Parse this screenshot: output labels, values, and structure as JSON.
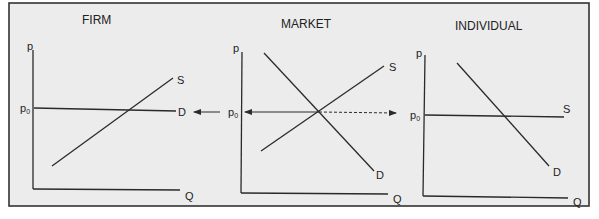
{
  "colors": {
    "background": "#ececec",
    "frame": "#333333",
    "line": "#2a2a2a",
    "page": "#ffffff"
  },
  "panels": [
    {
      "id": "firm",
      "title": "FIRM",
      "y_axis_label": "p",
      "x_axis_label": "Q",
      "price_label": "p",
      "price_subscript": "0",
      "curves": [
        {
          "name": "S",
          "label": "S",
          "type": "upward sloping supply"
        },
        {
          "name": "D",
          "label": "D",
          "type": "horizontal demand at p0"
        }
      ]
    },
    {
      "id": "market",
      "title": "MARKET",
      "y_axis_label": "p",
      "x_axis_label": "Q",
      "price_label": "p",
      "price_subscript": "0",
      "curves": [
        {
          "name": "S",
          "label": "S",
          "type": "upward sloping supply"
        },
        {
          "name": "D",
          "label": "D",
          "type": "downward sloping demand"
        }
      ],
      "arrows": [
        {
          "from": "market",
          "to": "firm",
          "style": "solid",
          "meaning": "market price transmitted to firm"
        },
        {
          "from": "market-equilibrium",
          "to": "individual",
          "style": "dashed",
          "meaning": "market price transmitted to individual"
        }
      ]
    },
    {
      "id": "individual",
      "title": "INDIVIDUAL",
      "y_axis_label": "p",
      "x_axis_label": "Q",
      "price_label": "p",
      "price_subscript": "0",
      "curves": [
        {
          "name": "S",
          "label": "S",
          "type": "horizontal supply at p0"
        },
        {
          "name": "D",
          "label": "D",
          "type": "downward sloping demand"
        }
      ]
    }
  ]
}
